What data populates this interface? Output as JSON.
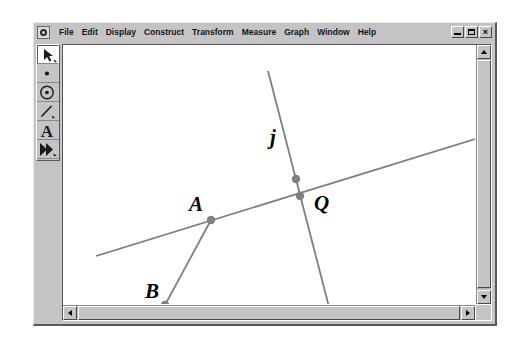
{
  "window": {
    "app_icon": "sketchpad-app-icon",
    "menus": [
      "File",
      "Edit",
      "Display",
      "Construct",
      "Transform",
      "Measure",
      "Graph",
      "Window",
      "Help"
    ],
    "controls": {
      "minimize": "minimize-icon",
      "restore": "restore-icon",
      "close": "×"
    }
  },
  "toolbox": {
    "tools": [
      {
        "name": "selection-arrow-tool",
        "icon": "arrow-icon",
        "selected": true
      },
      {
        "name": "point-tool",
        "icon": "point-icon",
        "selected": false
      },
      {
        "name": "compass-circle-tool",
        "icon": "circle-icon",
        "selected": false
      },
      {
        "name": "straightedge-line-tool",
        "icon": "segment-icon",
        "selected": false
      },
      {
        "name": "text-tool",
        "icon": "letter-a-icon",
        "selected": false
      },
      {
        "name": "custom-tool",
        "icon": "double-arrow-icon",
        "selected": false
      }
    ]
  },
  "scrollbars": {
    "vertical": {
      "up": "scroll-up-arrow",
      "down": "scroll-down-arrow"
    },
    "horizontal": {
      "left": "scroll-left-arrow",
      "right": "scroll-right-arrow"
    }
  },
  "sketch": {
    "stroke_color": "#808080",
    "point_color": "#808080",
    "label_color": "#000000",
    "labels": [
      {
        "text": "j",
        "x": 207,
        "y": 99
      },
      {
        "text": "A",
        "x": 126,
        "y": 166
      },
      {
        "text": "Q",
        "x": 251,
        "y": 165
      },
      {
        "text": "B",
        "x": 82,
        "y": 253
      }
    ],
    "points": [
      {
        "name": "point-A",
        "x": 148,
        "y": 175
      },
      {
        "name": "point-B",
        "x": 102,
        "y": 260
      },
      {
        "name": "point-Q",
        "x": 237,
        "y": 151
      },
      {
        "name": "point-on-line-j-upper",
        "x": 233,
        "y": 134
      },
      {
        "name": "point-on-line-j-lower",
        "x": 267,
        "y": 268
      }
    ],
    "lines": [
      {
        "name": "line-shallow",
        "x1": 33,
        "y1": 211,
        "x2": 412,
        "y2": 94
      },
      {
        "name": "line-j",
        "x1": 205,
        "y1": 26,
        "x2": 273,
        "y2": 289
      },
      {
        "name": "segment-AB",
        "x1": 148,
        "y1": 175,
        "x2": 102,
        "y2": 260
      }
    ]
  }
}
